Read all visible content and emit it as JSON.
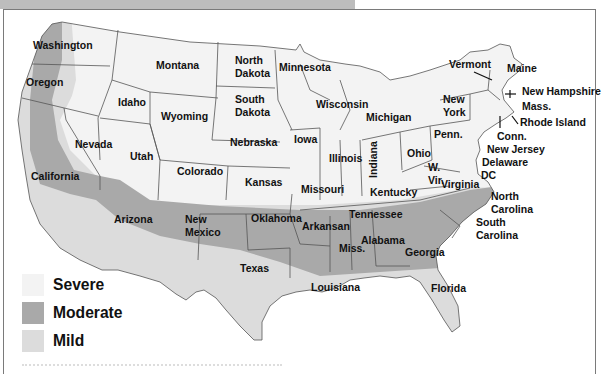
{
  "header": {
    "bar_color": "#bdbdbd"
  },
  "map": {
    "colors": {
      "severe": "#f3f3f3",
      "moderate": "#a9a9a9",
      "mild": "#dcdcdc",
      "border": "#555555",
      "frame": "#7a7a7a"
    },
    "states": [
      {
        "name": "Washington",
        "x": 33,
        "y": 49
      },
      {
        "name": "Oregon",
        "x": 26,
        "y": 86
      },
      {
        "name": "Idaho",
        "x": 118,
        "y": 106
      },
      {
        "name": "Montana",
        "x": 156,
        "y": 69
      },
      {
        "name": "Wyoming",
        "x": 161,
        "y": 120
      },
      {
        "name": "North Dakota",
        "x": 235,
        "y": 64
      },
      {
        "name": "South Dakota",
        "x": 235,
        "y": 103
      },
      {
        "name": "Minnesota",
        "x": 279,
        "y": 71
      },
      {
        "name": "Wisconsin",
        "x": 316,
        "y": 108
      },
      {
        "name": "Michigan",
        "x": 366,
        "y": 121
      },
      {
        "name": "Nevada",
        "x": 75,
        "y": 148
      },
      {
        "name": "Utah",
        "x": 130,
        "y": 160
      },
      {
        "name": "Colorado",
        "x": 177,
        "y": 175
      },
      {
        "name": "Nebraska",
        "x": 230,
        "y": 146
      },
      {
        "name": "Kansas",
        "x": 245,
        "y": 186
      },
      {
        "name": "Iowa",
        "x": 294,
        "y": 143
      },
      {
        "name": "Illinois",
        "x": 329,
        "y": 162
      },
      {
        "name": "Indiana",
        "x": 377,
        "y": 178
      },
      {
        "name": "Ohio",
        "x": 407,
        "y": 157
      },
      {
        "name": "Penn.",
        "x": 434,
        "y": 138
      },
      {
        "name": "New York",
        "x": 443,
        "y": 103
      },
      {
        "name": "California",
        "x": 31,
        "y": 180
      },
      {
        "name": "Arizona",
        "x": 114,
        "y": 223
      },
      {
        "name": "New Mexico",
        "x": 185,
        "y": 223
      },
      {
        "name": "Oklahoma",
        "x": 251,
        "y": 222
      },
      {
        "name": "Texas",
        "x": 240,
        "y": 272
      },
      {
        "name": "Missouri",
        "x": 301,
        "y": 193
      },
      {
        "name": "Kentucky",
        "x": 370,
        "y": 196
      },
      {
        "name": "W. Vir.",
        "x": 428,
        "y": 171
      },
      {
        "name": "Virginia",
        "x": 441,
        "y": 188
      },
      {
        "name": "Tennessee",
        "x": 349,
        "y": 218
      },
      {
        "name": "Arkansan",
        "x": 302,
        "y": 230
      },
      {
        "name": "Miss.",
        "x": 339,
        "y": 252
      },
      {
        "name": "Alabama",
        "x": 361,
        "y": 244
      },
      {
        "name": "Georgia",
        "x": 405,
        "y": 256
      },
      {
        "name": "Louisiana",
        "x": 311,
        "y": 291
      },
      {
        "name": "Florida",
        "x": 431,
        "y": 292
      },
      {
        "name": "North Carolina",
        "x": 491,
        "y": 200
      },
      {
        "name": "South Carolina",
        "x": 476,
        "y": 226
      },
      {
        "name": "Vermont",
        "x": 449,
        "y": 68
      },
      {
        "name": "Maine",
        "x": 507,
        "y": 72
      },
      {
        "name": "New Hampshire",
        "x": 522,
        "y": 95
      },
      {
        "name": "Mass.",
        "x": 522,
        "y": 110
      },
      {
        "name": "Rhode Island",
        "x": 520,
        "y": 126
      },
      {
        "name": "Conn.",
        "x": 497,
        "y": 140
      },
      {
        "name": "New Jersey",
        "x": 487,
        "y": 153
      },
      {
        "name": "Delaware",
        "x": 482,
        "y": 166
      },
      {
        "name": "DC",
        "x": 481,
        "y": 179
      }
    ]
  },
  "legend": {
    "items": [
      {
        "label": "Severe",
        "color": "#f3f3f3"
      },
      {
        "label": "Moderate",
        "color": "#a9a9a9"
      },
      {
        "label": "Mild",
        "color": "#dcdcdc"
      }
    ]
  }
}
